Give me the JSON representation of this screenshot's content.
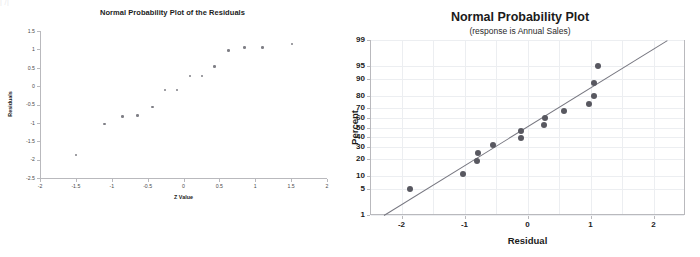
{
  "top_artifact_text": "|            /|",
  "left_chart": {
    "title": "Normal Probability Plot of the Residuals",
    "xlabel": "Z Value",
    "ylabel": "Residuals",
    "xticks": [
      "-2",
      "-1.5",
      "-1",
      "-0.5",
      "0",
      "0.5",
      "1",
      "1.5",
      "2"
    ],
    "yticks": [
      "1.5",
      "1",
      "0.5",
      "0",
      "-0.5",
      "-1",
      "-1.5",
      "-2",
      "-2.5"
    ]
  },
  "right_chart": {
    "title": "Normal Probability Plot",
    "subtitle": "(response is Annual Sales)",
    "xlabel": "Residual",
    "ylabel": "Percent",
    "xticks": [
      "-2",
      "-1",
      "0",
      "1",
      "2"
    ],
    "yticks": [
      "99",
      "95",
      "90",
      "80",
      "70",
      "60",
      "50",
      "40",
      "30",
      "20",
      "10",
      "5",
      "1"
    ]
  },
  "chart_data": [
    {
      "type": "scatter",
      "title": "Normal Probability Plot of the Residuals",
      "xlabel": "Z Value",
      "ylabel": "Residuals",
      "xlim": [
        -2,
        2
      ],
      "ylim": [
        -2.5,
        1.5
      ],
      "xticks": [
        -2,
        -1.5,
        -1,
        -0.5,
        0,
        0.5,
        1,
        1.5,
        2
      ],
      "yticks": [
        1.5,
        1,
        0.5,
        0,
        -0.5,
        -1,
        -1.5,
        -2,
        -2.5
      ],
      "grid": false,
      "legend": "none",
      "marker_color": "#7f7f86",
      "points": [
        {
          "x": -1.5,
          "y": -1.87
        },
        {
          "x": -1.1,
          "y": -1.03
        },
        {
          "x": -0.85,
          "y": -0.82
        },
        {
          "x": -0.64,
          "y": -0.8
        },
        {
          "x": -0.43,
          "y": -0.57
        },
        {
          "x": -0.26,
          "y": -0.1
        },
        {
          "x": -0.09,
          "y": -0.1
        },
        {
          "x": 0.09,
          "y": 0.27
        },
        {
          "x": 0.26,
          "y": 0.27
        },
        {
          "x": 0.43,
          "y": 0.54
        },
        {
          "x": 0.63,
          "y": 0.97
        },
        {
          "x": 0.85,
          "y": 1.05
        },
        {
          "x": 1.1,
          "y": 1.05
        },
        {
          "x": 1.51,
          "y": 1.15
        }
      ]
    },
    {
      "type": "scatter",
      "title": "Normal Probability Plot",
      "subtitle": "(response is Annual Sales)",
      "xlabel": "Residual",
      "ylabel": "Percent",
      "xlim": [
        -2.5,
        2.5
      ],
      "ylim": [
        1,
        99
      ],
      "yscale": "normal-probability",
      "xticks": [
        -2,
        -1,
        0,
        1,
        2
      ],
      "yticks": [
        1,
        5,
        10,
        20,
        30,
        40,
        50,
        60,
        70,
        80,
        90,
        95,
        99
      ],
      "grid": true,
      "legend": "none",
      "marker_color": "#585860",
      "reference_line": {
        "x1": -2.28,
        "y1": 1,
        "x2": 2.22,
        "y2": 99,
        "color": "#777780"
      },
      "points": [
        {
          "x": -1.87,
          "y": 5
        },
        {
          "x": -1.02,
          "y": 11
        },
        {
          "x": -0.8,
          "y": 19
        },
        {
          "x": -0.78,
          "y": 25
        },
        {
          "x": -0.55,
          "y": 32
        },
        {
          "x": -0.1,
          "y": 39
        },
        {
          "x": -0.1,
          "y": 46
        },
        {
          "x": 0.26,
          "y": 53
        },
        {
          "x": 0.27,
          "y": 60
        },
        {
          "x": 0.58,
          "y": 67
        },
        {
          "x": 0.97,
          "y": 73
        },
        {
          "x": 1.05,
          "y": 80
        },
        {
          "x": 1.05,
          "y": 88
        },
        {
          "x": 1.12,
          "y": 95
        }
      ]
    }
  ]
}
